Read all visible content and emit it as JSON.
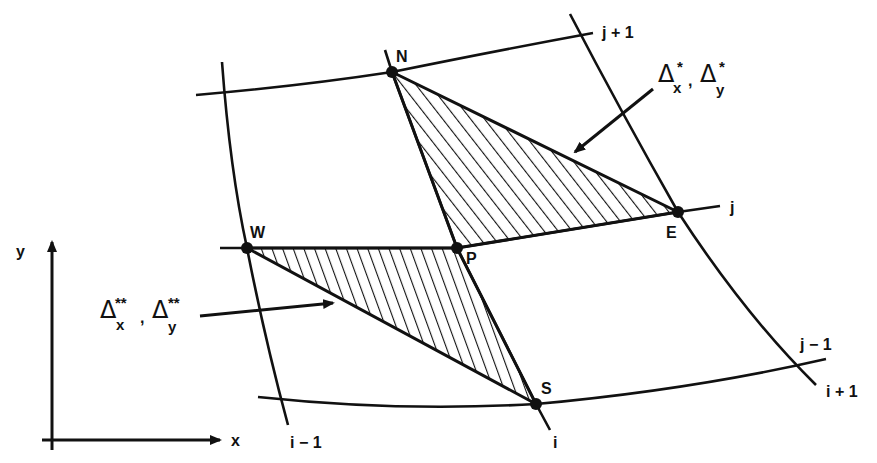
{
  "diagram": {
    "colors": {
      "ink": "#111111",
      "background": "#ffffff"
    },
    "nodes": {
      "N": {
        "label": "N",
        "x": 392,
        "y": 72
      },
      "E": {
        "label": "E",
        "x": 678,
        "y": 212
      },
      "P": {
        "label": "P",
        "x": 457,
        "y": 248
      },
      "W": {
        "label": "W",
        "x": 247,
        "y": 248
      },
      "S": {
        "label": "S",
        "x": 536,
        "y": 404
      }
    },
    "grid_labels": {
      "j_plus_1": "j + 1",
      "j": "j",
      "j_minus_1": "j − 1",
      "i_minus_1": "i − 1",
      "i": "i",
      "i_plus_1": "i + 1"
    },
    "axes": {
      "x_label": "x",
      "y_label": "y"
    },
    "annotations": {
      "upper_triangle": {
        "delta": "Δ",
        "sub_x": "x",
        "sub_y": "y",
        "sup": "*",
        "separator": ","
      },
      "lower_triangle": {
        "delta": "Δ",
        "sub_x": "x",
        "sub_y": "y",
        "sup": "**",
        "separator": ","
      }
    },
    "triangles": [
      {
        "name": "NPE",
        "vertices": [
          "N",
          "P",
          "E"
        ],
        "hatch": "diagonal"
      },
      {
        "name": "WPS",
        "vertices": [
          "W",
          "P",
          "S"
        ],
        "hatch": "steep-diagonal"
      }
    ]
  }
}
